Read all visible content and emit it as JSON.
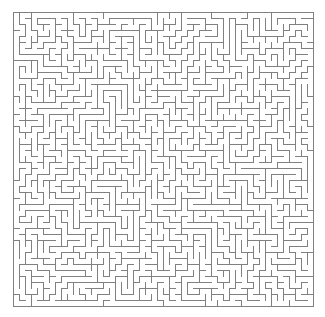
{
  "figure": {
    "kind": "maze-puzzle",
    "title": "",
    "background_color": "#ffffff",
    "width": 325,
    "height": 317
  },
  "maze": {
    "name": "rectangular-perfect-maze",
    "algorithm": "depth-first-search-spanning-tree",
    "columns": 50,
    "rows": 49,
    "cell_size": 6,
    "origin_x": 13,
    "origin_y": 12,
    "wall_color": "#808080",
    "wall_thickness": 1,
    "passage_color": "#ffffff",
    "border_closed": true,
    "entrance": "",
    "exit": "",
    "seed": 20240517
  }
}
